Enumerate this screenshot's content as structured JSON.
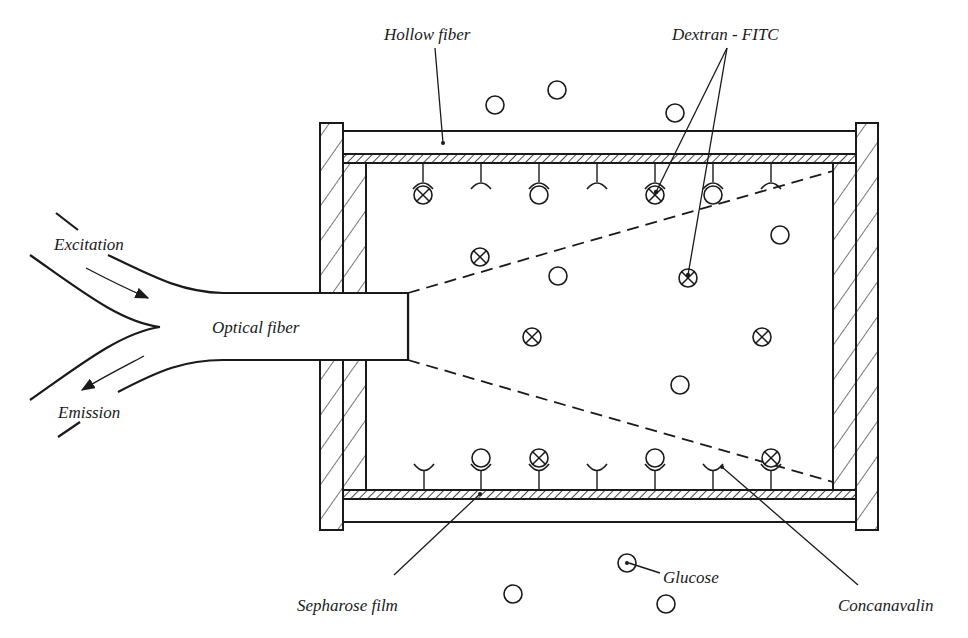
{
  "diagram": {
    "labels": {
      "hollow_fiber": "Hollow fiber",
      "dextran_fitc": "Dextran - FITC",
      "excitation": "Excitation",
      "emission": "Emission",
      "optical_fiber": "Optical fiber",
      "sepharose_film": "Sepharose film",
      "glucose": "Glucose",
      "concanavalin": "Concanavalin"
    },
    "legend_symbols": {
      "glucose": "circle",
      "dextran_fitc": "circle-with-x",
      "concanavalin": "cup-receptor-on-stem"
    },
    "top_receptors": [
      {
        "x": 423,
        "bound": "dextran"
      },
      {
        "x": 481,
        "bound": "none"
      },
      {
        "x": 539,
        "bound": "glucose"
      },
      {
        "x": 597,
        "bound": "none"
      },
      {
        "x": 655,
        "bound": "dextran"
      },
      {
        "x": 713,
        "bound": "glucose"
      },
      {
        "x": 771,
        "bound": "none"
      }
    ],
    "bottom_receptors": [
      {
        "x": 424,
        "bound": "none"
      },
      {
        "x": 481,
        "bound": "glucose"
      },
      {
        "x": 539,
        "bound": "dextran"
      },
      {
        "x": 597,
        "bound": "none"
      },
      {
        "x": 655,
        "bound": "glucose"
      },
      {
        "x": 713,
        "bound": "none"
      },
      {
        "x": 771,
        "bound": "dextran"
      }
    ],
    "free_glucose_inside": [
      {
        "x": 558,
        "y": 276
      },
      {
        "x": 680,
        "y": 385
      },
      {
        "x": 780,
        "y": 235
      }
    ],
    "free_dextran_inside": [
      {
        "x": 480,
        "y": 257
      },
      {
        "x": 532,
        "y": 337
      },
      {
        "x": 688,
        "y": 278
      },
      {
        "x": 762,
        "y": 337
      }
    ],
    "free_glucose_outside": [
      {
        "x": 495,
        "y": 105
      },
      {
        "x": 557,
        "y": 90
      },
      {
        "x": 675,
        "y": 113
      },
      {
        "x": 513,
        "y": 594
      },
      {
        "x": 666,
        "y": 604
      }
    ],
    "colors": {
      "ink": "#1a1a1a",
      "background": "#ffffff"
    }
  }
}
